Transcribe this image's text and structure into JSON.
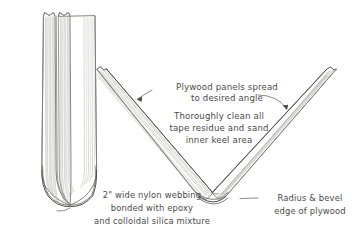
{
  "diagram": {
    "title": "Plywood keel panel assembly detail",
    "background_color": "#ffffff",
    "ink_color": "#4a4a48",
    "panel_stroke_color": "#6e6e6c",
    "grain_color": "#a9a9a7"
  },
  "annotations": {
    "plywood_spread": {
      "line1": "Plywood panels spread",
      "line2": "to desired angle"
    },
    "clean_tape": {
      "line1": "Thoroughly clean all",
      "line2": "tape residue and sand",
      "line3": "inner keel area"
    },
    "nylon_webbing": {
      "line1": "2\" wide nylon webbing",
      "line2": "bonded with epoxy",
      "line3": "and colloidal silica mixture"
    },
    "radius_bevel": {
      "line1": "Radius & bevel",
      "line2": "edge of plywood"
    }
  },
  "views": {
    "left_view": {
      "name": "closed-keel-elevation",
      "description": "Two plywood panels standing vertically closed together with rounded keel bottom"
    },
    "right_view": {
      "name": "spread-keel-vee",
      "description": "Two plywood panels spread open into a V shape joined at the keel"
    }
  }
}
